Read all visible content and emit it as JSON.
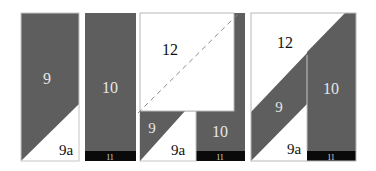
{
  "colors": {
    "dark": "#5e5e5e",
    "black": "#0a0a0a",
    "white": "#ffffff",
    "outline": "#b8b8b8",
    "dash": "#8a8a8a"
  },
  "panels": [
    {
      "id": "panel-1",
      "labels": {
        "piece_9": "9",
        "piece_9a": "9a"
      }
    },
    {
      "id": "panel-2",
      "labels": {
        "piece_10": "10",
        "piece_11": "11"
      }
    },
    {
      "id": "panel-3",
      "labels": {
        "piece_12": "12",
        "piece_9": "9",
        "piece_9a": "9a",
        "piece_10": "10",
        "piece_11": "11"
      }
    },
    {
      "id": "panel-4",
      "labels": {
        "piece_12": "12",
        "piece_9": "9",
        "piece_9a": "9a",
        "piece_10": "10",
        "piece_11": "11"
      }
    }
  ]
}
